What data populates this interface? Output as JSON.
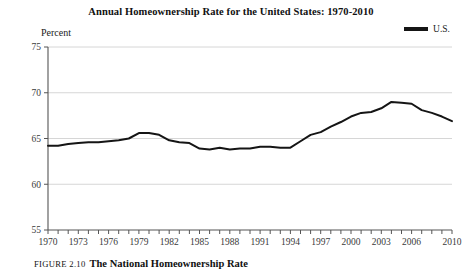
{
  "figure": {
    "caption_number": "Figure 2.10",
    "caption_text": "The National Homeownership Rate"
  },
  "legend": {
    "entries": [
      {
        "label": "U.S.",
        "color": "#151515",
        "marker": "line-swatch"
      }
    ],
    "position": "top-right"
  },
  "axis": {
    "y_title": "Percent"
  },
  "chart_data": {
    "type": "line",
    "title": "Annual Homeownership Rate for the United States: 1970-2010",
    "xlabel": "",
    "ylabel": "Percent",
    "xlim": [
      1970,
      2010
    ],
    "ylim": [
      55,
      75
    ],
    "grid": true,
    "grid_axis": "y",
    "legend_position": "top-right",
    "y_ticks": [
      55,
      60,
      65,
      70,
      75
    ],
    "x_ticks": [
      1970,
      1971,
      1972,
      1973,
      1974,
      1975,
      1976,
      1977,
      1978,
      1979,
      1980,
      1981,
      1982,
      1983,
      1984,
      1985,
      1986,
      1987,
      1988,
      1989,
      1990,
      1991,
      1992,
      1993,
      1994,
      1995,
      1996,
      1997,
      1998,
      1999,
      2000,
      2001,
      2002,
      2003,
      2004,
      2005,
      2006,
      2007,
      2008,
      2009,
      2010
    ],
    "x_tick_labels": [
      1970,
      1973,
      1976,
      1979,
      1982,
      1985,
      1988,
      1991,
      1994,
      1997,
      2000,
      2003,
      2006,
      2010
    ],
    "series": [
      {
        "name": "U.S.",
        "color": "#151515",
        "x": [
          1970,
          1971,
          1972,
          1973,
          1974,
          1975,
          1976,
          1977,
          1978,
          1979,
          1980,
          1981,
          1982,
          1983,
          1984,
          1985,
          1986,
          1987,
          1988,
          1989,
          1990,
          1991,
          1992,
          1993,
          1994,
          1995,
          1996,
          1997,
          1998,
          1999,
          2000,
          2001,
          2002,
          2003,
          2004,
          2005,
          2006,
          2007,
          2008,
          2009,
          2010
        ],
        "values": [
          64.2,
          64.2,
          64.4,
          64.5,
          64.6,
          64.6,
          64.7,
          64.8,
          65.0,
          65.6,
          65.6,
          65.4,
          64.8,
          64.6,
          64.5,
          63.9,
          63.8,
          64.0,
          63.8,
          63.9,
          63.9,
          64.1,
          64.1,
          64.0,
          64.0,
          64.7,
          65.4,
          65.7,
          66.3,
          66.8,
          67.4,
          67.8,
          67.9,
          68.3,
          69.0,
          68.9,
          68.8,
          68.1,
          67.8,
          67.4,
          66.9
        ]
      }
    ]
  }
}
